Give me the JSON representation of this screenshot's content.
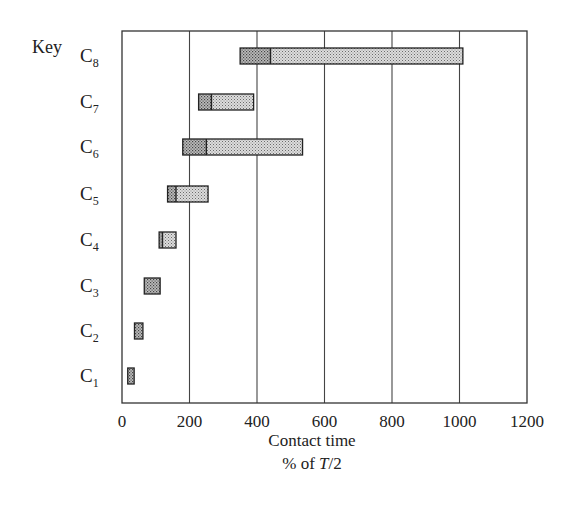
{
  "chart_data": {
    "type": "bar",
    "orientation": "horizontal",
    "subtype": "floating-range",
    "title": "",
    "legend_title": "Key",
    "categories": [
      "C1",
      "C2",
      "C3",
      "C4",
      "C5",
      "C6",
      "C7",
      "C8"
    ],
    "category_labels": [
      {
        "base": "C",
        "sub": "1"
      },
      {
        "base": "C",
        "sub": "2"
      },
      {
        "base": "C",
        "sub": "3"
      },
      {
        "base": "C",
        "sub": "4"
      },
      {
        "base": "C",
        "sub": "5"
      },
      {
        "base": "C",
        "sub": "6"
      },
      {
        "base": "C",
        "sub": "7"
      },
      {
        "base": "C",
        "sub": "8"
      }
    ],
    "series": [
      {
        "name": "C1",
        "start": 17,
        "divider": null,
        "end": 36
      },
      {
        "name": "C2",
        "start": 37,
        "divider": null,
        "end": 62
      },
      {
        "name": "C3",
        "start": 66,
        "divider": null,
        "end": 113
      },
      {
        "name": "C4",
        "start": 110,
        "divider": 120,
        "end": 160
      },
      {
        "name": "C5",
        "start": 135,
        "divider": 160,
        "end": 255
      },
      {
        "name": "C6",
        "start": 180,
        "divider": 250,
        "end": 535
      },
      {
        "name": "C7",
        "start": 227,
        "divider": 265,
        "end": 390
      },
      {
        "name": "C8",
        "start": 350,
        "divider": 440,
        "end": 1010
      }
    ],
    "xlabel": "Contact time",
    "xlabel_line2": "% of T/2",
    "ylabel": "",
    "xlim": [
      0,
      1200
    ],
    "xticks": [
      0,
      200,
      400,
      600,
      800,
      1000,
      1200
    ],
    "xtick_labels": [
      "0",
      "200",
      "400",
      "600",
      "800",
      "1000",
      "1200"
    ],
    "grid": {
      "vertical": true,
      "horizontal": false
    },
    "bar_fill": "stippled",
    "colors": {
      "frame": "#333333",
      "bar_fill": "#d9d9d9",
      "bar_stipple": "#6b6b6b",
      "grid": "#444444"
    }
  },
  "labels": {
    "key": "Key",
    "xlabel_line1": "Contact time",
    "xlabel_pct": "% of ",
    "xlabel_T": "T",
    "xlabel_half": "/2"
  }
}
